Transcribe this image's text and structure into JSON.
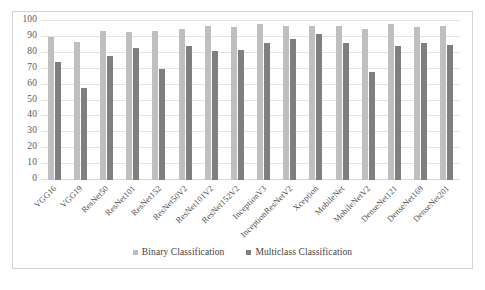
{
  "chart_data": {
    "type": "bar",
    "title": "",
    "xlabel": "",
    "ylabel": "",
    "ylim": [
      0,
      100
    ],
    "ytick_step": 10,
    "yticks": [
      100,
      90,
      80,
      70,
      60,
      50,
      40,
      30,
      20,
      10,
      0
    ],
    "grid": true,
    "legend_position": "bottom",
    "categories": [
      "VGG16",
      "VGG19",
      "ResNet50",
      "ResNet101",
      "ResNet152",
      "ResNet50V2",
      "ResNet101V2",
      "ResNet152V2",
      "InceptionV3",
      "InceptionResNetV2",
      "Xception",
      "MobileNet",
      "MobileNetV2",
      "DenseNet121",
      "DenseNet169",
      "DenseNet201"
    ],
    "series": [
      {
        "name": "Binary Classification",
        "color": "#bfbfbf",
        "values": [
          90,
          87,
          94,
          93,
          94,
          95,
          97,
          96,
          98,
          97,
          97,
          97,
          95,
          98,
          96,
          97
        ]
      },
      {
        "name": "Multiclass Classification",
        "color": "#7f7f7f",
        "values": [
          74,
          58,
          78,
          83,
          70,
          84,
          81,
          82,
          86,
          89,
          92,
          86,
          68,
          84,
          86,
          85
        ]
      }
    ]
  },
  "legend": {
    "entries": [
      {
        "label": "Binary Classification",
        "series_key": "binary"
      },
      {
        "label": "Multiclass Classification",
        "series_key": "multi"
      }
    ]
  },
  "colors": {
    "binary": "#bfbfbf",
    "multiclass": "#7f7f7f",
    "gridline": "#e4e4e4",
    "frame_border": "#d4d4d4",
    "text": "#4a4a4a",
    "background": "#ffffff"
  }
}
